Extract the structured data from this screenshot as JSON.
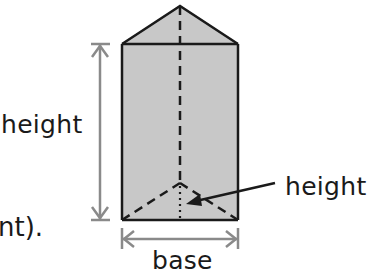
{
  "diagram": {
    "labels": {
      "prism_height": "height",
      "triangle_height": "height",
      "base": "base",
      "text_fragment": "nt)."
    },
    "colors": {
      "fill": "#c8c8c8",
      "edge": "#1a1a1a",
      "dimension": "#8a8a8a",
      "text": "#1a1a1a"
    },
    "shape": {
      "type": "triangular prism",
      "front_face": {
        "x1": 122,
        "y1": 44,
        "x2": 238,
        "y2": 220
      },
      "apex_top": {
        "x": 180,
        "y": 6
      },
      "hidden_vertex_bottom": {
        "x": 180,
        "y": 183
      }
    }
  }
}
